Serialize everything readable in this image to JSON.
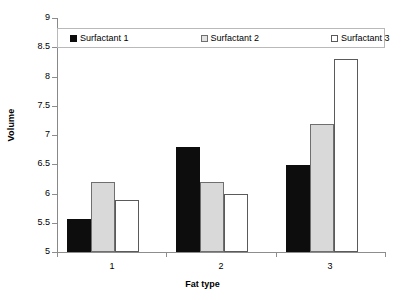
{
  "chart_data": {
    "type": "bar",
    "title": "",
    "xlabel": "Fat type",
    "ylabel": "Volume",
    "categories": [
      "1",
      "2",
      "3"
    ],
    "series": [
      {
        "name": "Surfactant 1",
        "color": "#0d0d0d",
        "values": [
          5.57,
          6.8,
          6.49
        ]
      },
      {
        "name": "Surfactant 2",
        "color": "#d9d9d9",
        "values": [
          6.19,
          6.19,
          7.19
        ]
      },
      {
        "name": "Surfactant 3",
        "color": "#ffffff",
        "values": [
          5.89,
          5.99,
          8.3
        ]
      }
    ],
    "ylim": [
      5,
      9
    ],
    "yticks": [
      "5",
      "5.5",
      "6",
      "6.5",
      "7",
      "7.5",
      "8",
      "8.5",
      "9"
    ],
    "ytick_values": [
      5,
      5.5,
      6,
      6.5,
      7,
      7.5,
      8,
      8.5,
      9
    ],
    "grid": false,
    "legend_position": "top-inside"
  },
  "legend": {
    "items": [
      {
        "label": "Surfactant 1",
        "swatch": "filled-black-swatch"
      },
      {
        "label": "Surfactant 2",
        "swatch": "filled-gray-swatch"
      },
      {
        "label": "Surfactant 3",
        "swatch": "empty-white-swatch"
      }
    ]
  },
  "axes": {
    "y_title": "Volume",
    "x_title": "Fat type"
  }
}
